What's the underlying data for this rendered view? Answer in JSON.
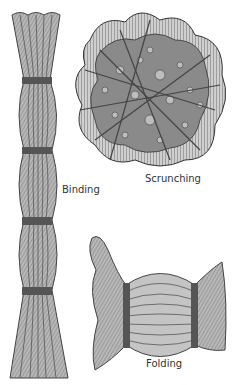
{
  "figure": {
    "panels": [
      {
        "id": "binding",
        "label": "Binding"
      },
      {
        "id": "scrunching",
        "label": "Scrunching"
      },
      {
        "id": "folding",
        "label": "Folding"
      }
    ]
  },
  "colors": {
    "strand_fill": "#b0b0b0",
    "strand_line": "#444444",
    "band": "#555555",
    "label": "#333333"
  }
}
